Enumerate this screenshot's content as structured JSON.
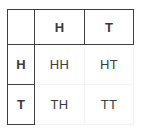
{
  "diagram": {
    "kind": "outcome-table",
    "colors": {
      "header_border": "#3f3f3f",
      "body_border": "#f2f2f2",
      "text": "#3c3c3c",
      "background": "#ffffff"
    },
    "corner_label": "",
    "column_headers": [
      "H",
      "T"
    ],
    "row_headers": [
      "H",
      "T"
    ],
    "cells": [
      [
        "HH",
        "HT"
      ],
      [
        "TH",
        "TT"
      ]
    ]
  }
}
